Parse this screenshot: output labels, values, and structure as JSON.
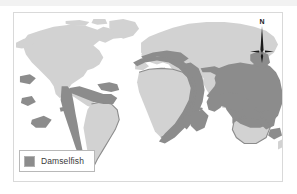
{
  "figure": {
    "kind": "world-distribution-map",
    "background_color": "#ffffff",
    "frame_border_color": "#d9d9d9"
  },
  "map": {
    "land_color": "#d2d2d2",
    "ocean_color": "#ffffff",
    "range_color": "#8c8c8c",
    "coast_outline_color": "#8c8c8c",
    "projection_note": "world equirectangular"
  },
  "legend": {
    "swatch_color": "#8c8c8c",
    "border_color": "#b8b8b8",
    "items": [
      {
        "label": "Damselfish",
        "color": "#8c8c8c"
      }
    ]
  },
  "compass": {
    "north_label": "N",
    "icon": "compass-needle-icon",
    "color": "#1a1a1a"
  }
}
